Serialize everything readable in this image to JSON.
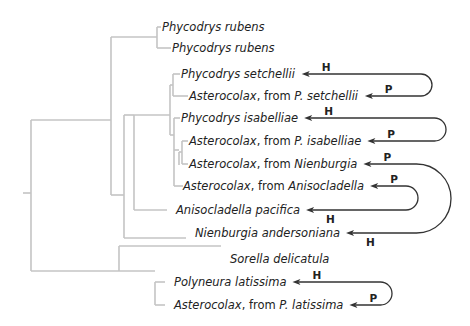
{
  "figure": {
    "type": "phylogenetic tree with host-parasite links",
    "taxa": [
      {
        "id": "t1",
        "parts": [
          {
            "text": "Phycodrys rubens",
            "italic": true
          }
        ]
      },
      {
        "id": "t2",
        "parts": [
          {
            "text": "Phycodrys rubens",
            "italic": true
          }
        ]
      },
      {
        "id": "t3",
        "parts": [
          {
            "text": "Phycodrys setchellii",
            "italic": true
          }
        ]
      },
      {
        "id": "t4",
        "parts": [
          {
            "text": "Asterocolax",
            "italic": true
          },
          {
            "text": ", from ",
            "italic": false
          },
          {
            "text": "P. setchellii",
            "italic": true
          }
        ]
      },
      {
        "id": "t5",
        "parts": [
          {
            "text": "Phycodrys isabelliae",
            "italic": true
          }
        ]
      },
      {
        "id": "t6",
        "parts": [
          {
            "text": "Asterocolax",
            "italic": true
          },
          {
            "text": ", from ",
            "italic": false
          },
          {
            "text": "P. isabelliae",
            "italic": true
          }
        ]
      },
      {
        "id": "t7",
        "parts": [
          {
            "text": "Asterocolax",
            "italic": true
          },
          {
            "text": ", from ",
            "italic": false
          },
          {
            "text": "Nienburgia",
            "italic": true
          }
        ]
      },
      {
        "id": "t8",
        "parts": [
          {
            "text": "Asterocolax",
            "italic": true
          },
          {
            "text": ", from ",
            "italic": false
          },
          {
            "text": "Anisocladella",
            "italic": true
          }
        ]
      },
      {
        "id": "t9",
        "parts": [
          {
            "text": "Anisocladella pacifica",
            "italic": true
          }
        ]
      },
      {
        "id": "t10",
        "parts": [
          {
            "text": "Nienburgia andersoniana",
            "italic": true
          }
        ]
      },
      {
        "id": "t11",
        "parts": [
          {
            "text": "Sorella delicatula",
            "italic": true
          }
        ]
      },
      {
        "id": "t12",
        "parts": [
          {
            "text": "Polyneura latissima",
            "italic": true
          }
        ]
      },
      {
        "id": "t13",
        "parts": [
          {
            "text": "Asterocolax",
            "italic": true
          },
          {
            "text": ", from ",
            "italic": false
          },
          {
            "text": "P. latissima",
            "italic": true
          }
        ]
      }
    ],
    "links": [
      {
        "host": "t3",
        "parasite": "t4",
        "host_tag": "H",
        "parasite_tag": "P"
      },
      {
        "host": "t5",
        "parasite": "t6",
        "host_tag": "H",
        "parasite_tag": "P"
      },
      {
        "host": "t10",
        "parasite": "t7",
        "host_tag": "H",
        "parasite_tag": "P"
      },
      {
        "host": "t9",
        "parasite": "t8",
        "host_tag": "H",
        "parasite_tag": "P"
      },
      {
        "host": "t12",
        "parasite": "t13",
        "host_tag": "H",
        "parasite_tag": "P"
      }
    ],
    "colors": {
      "branch": "#c4c4c4",
      "arrow": "#333333",
      "text": "#222222"
    }
  }
}
